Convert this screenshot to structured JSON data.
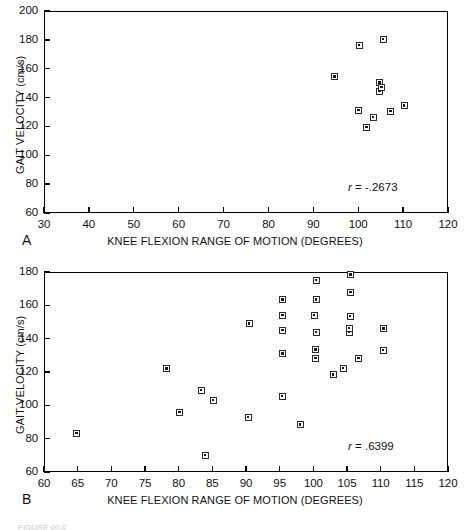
{
  "figure": {
    "axis_title_x": "KNEE FLEXION RANGE OF MOTION (DEGREES)",
    "axis_title_y": "GAIT VELOCITY (cm/s)",
    "caption_partial": "FIGURE 00-0"
  },
  "panels": [
    {
      "letter": "A",
      "annotation": "r = -.2673",
      "r_value": -0.2673
    },
    {
      "letter": "B",
      "annotation": "r = .6399",
      "r_value": 0.6399
    }
  ],
  "chart_data": [
    {
      "type": "scatter",
      "panel": "A",
      "title": "",
      "xlabel": "KNEE FLEXION RANGE OF MOTION (DEGREES)",
      "ylabel": "GAIT VELOCITY (cm/s)",
      "xlim": [
        30,
        120
      ],
      "ylim": [
        60,
        200
      ],
      "xticks": [
        30,
        40,
        50,
        60,
        70,
        80,
        90,
        100,
        110,
        120
      ],
      "yticks": [
        60,
        80,
        100,
        120,
        140,
        160,
        180,
        200
      ],
      "grid": false,
      "legend": null,
      "annotation": "r = -.2673",
      "correlation": -0.2673,
      "n_points": 11,
      "marker": "square-with-center-dot",
      "points": [
        {
          "x": 94.6,
          "y": 155
        },
        {
          "x": 100.0,
          "y": 177
        },
        {
          "x": 105.3,
          "y": 181
        },
        {
          "x": 104.6,
          "y": 151
        },
        {
          "x": 104.6,
          "y": 145
        },
        {
          "x": 99.9,
          "y": 132
        },
        {
          "x": 101.7,
          "y": 120
        },
        {
          "x": 103.1,
          "y": 127
        },
        {
          "x": 107.0,
          "y": 131
        },
        {
          "x": 110.0,
          "y": 135
        },
        {
          "x": 105.0,
          "y": 148
        }
      ]
    },
    {
      "type": "scatter",
      "panel": "B",
      "title": "",
      "xlabel": "KNEE FLEXION RANGE OF MOTION (DEGREES)",
      "ylabel": "GAIT VELOCITY (cm/s)",
      "xlim": [
        60,
        120
      ],
      "ylim": [
        60,
        180
      ],
      "xticks": [
        60,
        65,
        70,
        75,
        80,
        85,
        90,
        95,
        100,
        105,
        110,
        115,
        120
      ],
      "yticks": [
        60,
        80,
        100,
        120,
        140,
        160,
        180
      ],
      "grid": false,
      "legend": null,
      "annotation": "r = .6399",
      "correlation": 0.6399,
      "n_points": 30,
      "marker": "square-with-center-dot",
      "points": [
        {
          "x": 64.7,
          "y": 84
        },
        {
          "x": 78.1,
          "y": 122.5
        },
        {
          "x": 80.0,
          "y": 96.5
        },
        {
          "x": 83.2,
          "y": 109.5
        },
        {
          "x": 83.8,
          "y": 70.5
        },
        {
          "x": 85.0,
          "y": 103.5
        },
        {
          "x": 90.2,
          "y": 93.5
        },
        {
          "x": 90.3,
          "y": 149.5
        },
        {
          "x": 95.2,
          "y": 106
        },
        {
          "x": 95.3,
          "y": 131.5
        },
        {
          "x": 95.3,
          "y": 145.5
        },
        {
          "x": 95.3,
          "y": 154.5
        },
        {
          "x": 95.3,
          "y": 164
        },
        {
          "x": 97.9,
          "y": 89
        },
        {
          "x": 100.2,
          "y": 129
        },
        {
          "x": 100.2,
          "y": 134
        },
        {
          "x": 100.3,
          "y": 144.5
        },
        {
          "x": 100.3,
          "y": 164
        },
        {
          "x": 100.3,
          "y": 175.5
        },
        {
          "x": 102.8,
          "y": 119
        },
        {
          "x": 104.3,
          "y": 123
        },
        {
          "x": 105.2,
          "y": 144.5
        },
        {
          "x": 105.2,
          "y": 147
        },
        {
          "x": 105.3,
          "y": 154
        },
        {
          "x": 105.4,
          "y": 168.5
        },
        {
          "x": 105.4,
          "y": 179
        },
        {
          "x": 106.6,
          "y": 129
        },
        {
          "x": 110.2,
          "y": 133.5
        },
        {
          "x": 110.3,
          "y": 146.5
        },
        {
          "x": 100.0,
          "y": 154.5
        }
      ]
    }
  ]
}
